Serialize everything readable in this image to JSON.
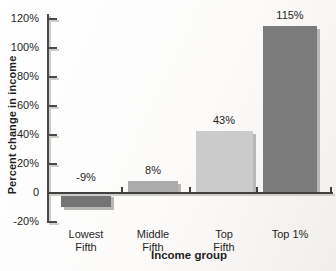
{
  "chart_data": {
    "type": "bar",
    "xlabel": "Income group",
    "ylabel": "Percent change in income",
    "categories": [
      "Lowest\nFifth",
      "Middle\nFifth",
      "Top\nFifth",
      "Top 1%"
    ],
    "values": [
      -9,
      8,
      43,
      115
    ],
    "value_labels": [
      "-9%",
      "8%",
      "43%",
      "115%"
    ],
    "bar_colors": [
      "#747474",
      "#ababab",
      "#cbcbcb",
      "#7b7b7b"
    ],
    "bar_shadow_color": "#b9b7b4",
    "axis_color": "#404040",
    "axis_shadow_color": "#cfcdca",
    "text_color": "#1e1e1e",
    "background_color": "#fcfbfa",
    "ylim": [
      -20,
      120
    ],
    "yticks": [
      120,
      100,
      80,
      60,
      40,
      20,
      0,
      -20
    ],
    "ytick_labels": [
      "120%",
      "100%",
      "80%",
      "60%",
      "40%",
      "20%",
      "0",
      "-20%"
    ],
    "grid": false,
    "legend": null
  }
}
